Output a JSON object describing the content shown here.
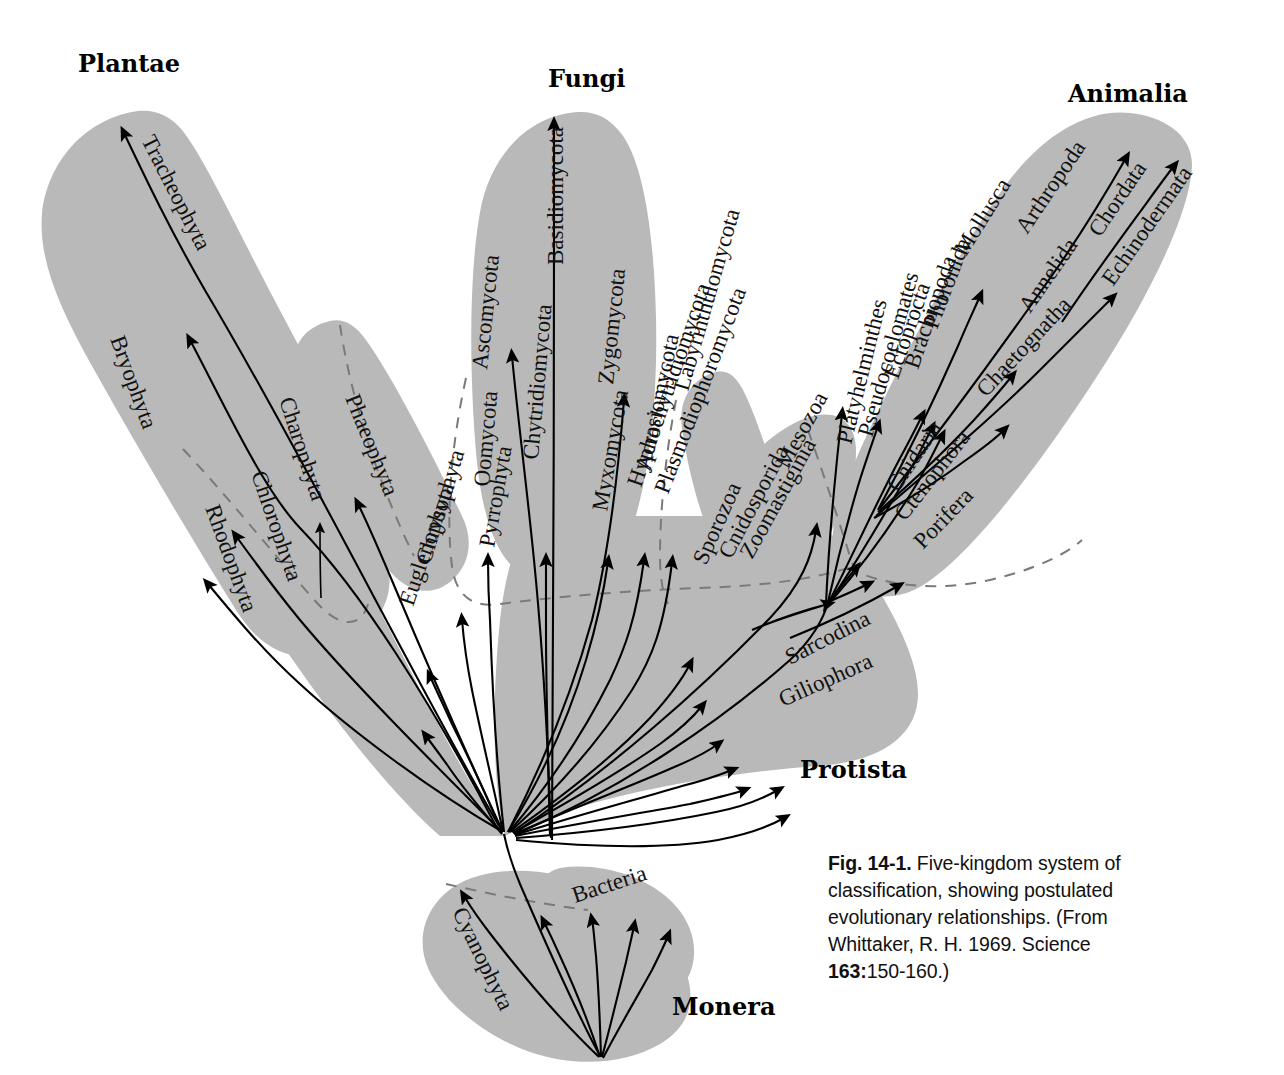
{
  "figure": {
    "gray_fill": "#b9b9b9",
    "divider_color": "#7a7a7a",
    "line_color": "#000000"
  },
  "kingdoms": [
    {
      "id": "plantae",
      "label": "Plantae",
      "x": 78,
      "y": 72
    },
    {
      "id": "fungi",
      "label": "Fungi",
      "x": 548,
      "y": 87
    },
    {
      "id": "animalia",
      "label": "Animalia",
      "x": 1068,
      "y": 102
    },
    {
      "id": "protista",
      "label": "Protista",
      "x": 800,
      "y": 778
    },
    {
      "id": "monera",
      "label": "Monera",
      "x": 672,
      "y": 1015
    }
  ],
  "taxa": {
    "plantae": [
      {
        "label": "Tracheophyta",
        "x": 141,
        "y": 140,
        "rot": 63
      },
      {
        "label": "Bryophyta",
        "x": 110,
        "y": 339,
        "rot": 70
      },
      {
        "label": "Charophyta",
        "x": 279,
        "y": 400,
        "rot": 72
      },
      {
        "label": "Phaeophyta",
        "x": 345,
        "y": 398,
        "rot": 68
      },
      {
        "label": "Chlorophyta",
        "x": 251,
        "y": 474,
        "rot": 71
      },
      {
        "label": "Rhodophyta",
        "x": 205,
        "y": 508,
        "rot": 70
      }
    ],
    "fungi": [
      {
        "label": "Basidiomycota",
        "x": 563,
        "y": 265,
        "rot": 90
      },
      {
        "label": "Ascomycota",
        "x": 487,
        "y": 370,
        "rot": 84
      },
      {
        "label": "Zygomycota",
        "x": 613,
        "y": 385,
        "rot": 84
      },
      {
        "label": "Chytridiomycota",
        "x": 538,
        "y": 460,
        "rot": 85
      },
      {
        "label": "Myxomycota",
        "x": 607,
        "y": 512,
        "rot": 80
      },
      {
        "label": "Acrasiomycota",
        "x": 650,
        "y": 472,
        "rot": 78
      },
      {
        "label": "Labyrinthulomycota",
        "x": 688,
        "y": 392,
        "rot": 74
      }
    ],
    "protista": [
      {
        "label": "Oomycota",
        "x": 489,
        "y": 487,
        "rot": 85
      },
      {
        "label": "Chrysophyta",
        "x": 430,
        "y": 565,
        "rot": 73
      },
      {
        "label": "Euglenophyta",
        "x": 413,
        "y": 607,
        "rot": 71
      },
      {
        "label": "Pyrrophyta",
        "x": 494,
        "y": 548,
        "rot": 80
      },
      {
        "label": "Hyphochytridiomycota",
        "x": 641,
        "y": 488,
        "rot": 71
      },
      {
        "label": "Plasmodiophoromycota",
        "x": 668,
        "y": 495,
        "rot": 69
      },
      {
        "label": "Sporozoa",
        "x": 706,
        "y": 566,
        "rot": 66
      },
      {
        "label": "Cnidosporida",
        "x": 731,
        "y": 560,
        "rot": 62
      },
      {
        "label": "Zoomastiginia",
        "x": 752,
        "y": 560,
        "rot": 61
      },
      {
        "label": "Mesozoa",
        "x": 788,
        "y": 470,
        "rot": 61
      },
      {
        "label": "Sarcodina",
        "x": 790,
        "y": 665,
        "rot": 27
      },
      {
        "label": "Giliophora",
        "x": 783,
        "y": 707,
        "rot": 24
      }
    ],
    "animalia": [
      {
        "label": "Platyhelminthes",
        "x": 851,
        "y": 445,
        "rot": 76
      },
      {
        "label": "Pseudocoelomates",
        "x": 872,
        "y": 438,
        "rot": 74
      },
      {
        "label": "Ectoprocta",
        "x": 898,
        "y": 380,
        "rot": 71
      },
      {
        "label": "Brachiopoda",
        "x": 918,
        "y": 370,
        "rot": 71
      },
      {
        "label": "Phoronida",
        "x": 937,
        "y": 330,
        "rot": 69
      },
      {
        "label": "Mollusca",
        "x": 966,
        "y": 257,
        "rot": 58
      },
      {
        "label": "Arthropoda",
        "x": 1027,
        "y": 235,
        "rot": 56
      },
      {
        "label": "Annelida",
        "x": 1030,
        "y": 314,
        "rot": 55
      },
      {
        "label": "Chaetognatha",
        "x": 986,
        "y": 398,
        "rot": 47
      },
      {
        "label": "Chordata",
        "x": 1100,
        "y": 238,
        "rot": 56
      },
      {
        "label": "Echinodermata",
        "x": 1113,
        "y": 287,
        "rot": 55
      },
      {
        "label": "Cnidaria",
        "x": 898,
        "y": 493,
        "rot": 56
      },
      {
        "label": "Ctenophora",
        "x": 905,
        "y": 522,
        "rot": 52
      },
      {
        "label": "Porifera",
        "x": 923,
        "y": 550,
        "rot": 46
      }
    ],
    "monera": [
      {
        "label": "Cyanophyta",
        "x": 452,
        "y": 912,
        "rot": 64
      },
      {
        "label": "Bacteria",
        "x": 575,
        "y": 903,
        "rot": 18
      }
    ]
  },
  "caption": {
    "figure_number": "Fig. 14-1.",
    "text_1": " Five-kingdom system of classification, showing postulated evolutionary relationships. (From Whittaker, R. H. 1969. Science ",
    "volume": "163:",
    "text_2": "150-160.)"
  }
}
